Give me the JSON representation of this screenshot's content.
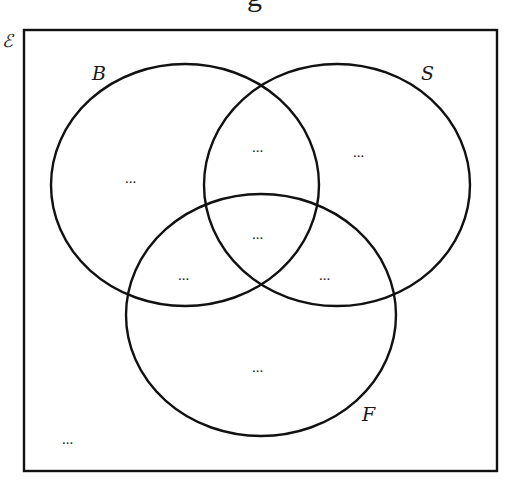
{
  "header": {
    "cut_off_title_fragment": "g"
  },
  "universal_set": {
    "symbol": "ℰ"
  },
  "sets": {
    "B": {
      "label": "B"
    },
    "S": {
      "label": "S"
    },
    "F": {
      "label": "F"
    }
  },
  "regions": {
    "B_only": "...",
    "S_only": "...",
    "F_only": "...",
    "B_and_S_only": "...",
    "B_and_F_only": "...",
    "S_and_F_only": "...",
    "B_S_F": "...",
    "outside": "..."
  },
  "colors": {
    "stroke": "#111111",
    "background": "#ffffff"
  }
}
